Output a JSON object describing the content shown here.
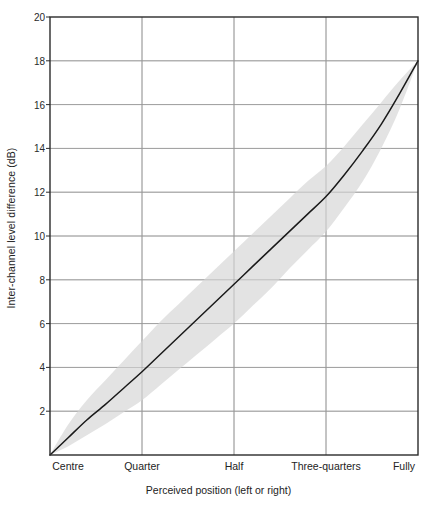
{
  "chart_data": {
    "type": "line",
    "title": "",
    "xlabel": "Perceived position (left or right)",
    "ylabel": "Inter-channel level difference (dB)",
    "ylim": [
      0,
      20
    ],
    "yticks": [
      2,
      4,
      6,
      8,
      10,
      12,
      14,
      16,
      18,
      20
    ],
    "ytick_labels": [
      "2",
      "4",
      "6",
      "8",
      "10",
      "12",
      "14",
      "16",
      "18",
      "20"
    ],
    "grid": true,
    "legend": "none",
    "categories": [
      "Centre",
      "Quarter",
      "Half",
      "Three-quarters",
      "Fully"
    ],
    "x": [
      0,
      0.25,
      0.5,
      0.75,
      1
    ],
    "series": [
      {
        "name": "Inter-channel level difference",
        "values": [
          0,
          3.8,
          7.8,
          11.8,
          18.0
        ]
      }
    ],
    "band": {
      "name": "Spread of listener responses",
      "upper": [
        0,
        5.2,
        9.3,
        13.2,
        18.0
      ],
      "lower": [
        0,
        2.5,
        6.0,
        10.2,
        18.0
      ],
      "color": "#e2e2e2"
    },
    "curve_points": [
      {
        "x": 0.0,
        "y": 0.0
      },
      {
        "x": 0.05,
        "y": 0.8
      },
      {
        "x": 0.1,
        "y": 1.6
      },
      {
        "x": 0.15,
        "y": 2.3
      },
      {
        "x": 0.2,
        "y": 3.05
      },
      {
        "x": 0.25,
        "y": 3.8
      },
      {
        "x": 0.3,
        "y": 4.6
      },
      {
        "x": 0.35,
        "y": 5.4
      },
      {
        "x": 0.4,
        "y": 6.2
      },
      {
        "x": 0.45,
        "y": 7.0
      },
      {
        "x": 0.5,
        "y": 7.8
      },
      {
        "x": 0.55,
        "y": 8.6
      },
      {
        "x": 0.6,
        "y": 9.4
      },
      {
        "x": 0.65,
        "y": 10.2
      },
      {
        "x": 0.7,
        "y": 11.0
      },
      {
        "x": 0.75,
        "y": 11.8
      },
      {
        "x": 0.8,
        "y": 12.8
      },
      {
        "x": 0.85,
        "y": 13.9
      },
      {
        "x": 0.9,
        "y": 15.1
      },
      {
        "x": 0.95,
        "y": 16.5
      },
      {
        "x": 1.0,
        "y": 18.0
      }
    ],
    "band_upper_points": [
      {
        "x": 0.0,
        "y": 0.0
      },
      {
        "x": 0.05,
        "y": 1.4
      },
      {
        "x": 0.1,
        "y": 2.5
      },
      {
        "x": 0.15,
        "y": 3.4
      },
      {
        "x": 0.2,
        "y": 4.3
      },
      {
        "x": 0.25,
        "y": 5.2
      },
      {
        "x": 0.3,
        "y": 6.1
      },
      {
        "x": 0.35,
        "y": 6.9
      },
      {
        "x": 0.4,
        "y": 7.7
      },
      {
        "x": 0.45,
        "y": 8.5
      },
      {
        "x": 0.5,
        "y": 9.3
      },
      {
        "x": 0.55,
        "y": 10.1
      },
      {
        "x": 0.6,
        "y": 10.9
      },
      {
        "x": 0.65,
        "y": 11.7
      },
      {
        "x": 0.7,
        "y": 12.5
      },
      {
        "x": 0.75,
        "y": 13.2
      },
      {
        "x": 0.8,
        "y": 14.1
      },
      {
        "x": 0.85,
        "y": 15.1
      },
      {
        "x": 0.9,
        "y": 16.1
      },
      {
        "x": 0.95,
        "y": 17.1
      },
      {
        "x": 1.0,
        "y": 18.0
      }
    ],
    "band_lower_points": [
      {
        "x": 0.0,
        "y": 0.0
      },
      {
        "x": 0.05,
        "y": 0.4
      },
      {
        "x": 0.1,
        "y": 0.9
      },
      {
        "x": 0.15,
        "y": 1.4
      },
      {
        "x": 0.2,
        "y": 1.95
      },
      {
        "x": 0.25,
        "y": 2.5
      },
      {
        "x": 0.3,
        "y": 3.2
      },
      {
        "x": 0.35,
        "y": 3.9
      },
      {
        "x": 0.4,
        "y": 4.6
      },
      {
        "x": 0.45,
        "y": 5.3
      },
      {
        "x": 0.5,
        "y": 6.0
      },
      {
        "x": 0.55,
        "y": 6.8
      },
      {
        "x": 0.6,
        "y": 7.6
      },
      {
        "x": 0.65,
        "y": 8.5
      },
      {
        "x": 0.7,
        "y": 9.35
      },
      {
        "x": 0.75,
        "y": 10.2
      },
      {
        "x": 0.8,
        "y": 11.3
      },
      {
        "x": 0.85,
        "y": 12.5
      },
      {
        "x": 0.9,
        "y": 14.0
      },
      {
        "x": 0.95,
        "y": 15.8
      },
      {
        "x": 1.0,
        "y": 18.0
      }
    ],
    "colors": {
      "curve": "#1a1a1a",
      "band": "#e2e2e2",
      "grid": "#9a9a9a",
      "axis": "#2b2b2b",
      "background": "#ffffff"
    },
    "geometry": {
      "left": 50,
      "right": 418,
      "top": 17,
      "bottom": 455
    }
  }
}
